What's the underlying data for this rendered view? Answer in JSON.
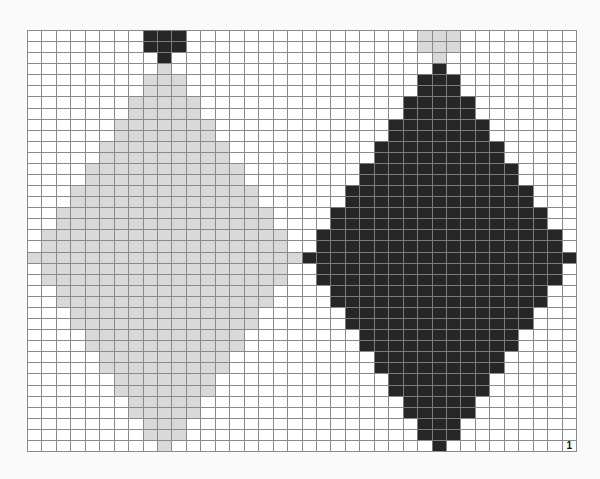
{
  "figure": {
    "label": "1",
    "grid": {
      "columns": 38,
      "rows": 38,
      "legend": {
        ".": "white",
        "L": "light-gray",
        "D": "dark"
      },
      "colors": {
        "white": "#ffffff",
        "light": "#d9d9d9",
        "dark": "#262626",
        "line": "#8a8a8a"
      },
      "cells": [
        "........DDD................LLL........",
        "........DDD................LLL........",
        ".........D..................L.........",
        ".........L..................D.........",
        "........LLL................DDD........",
        "........LLL................DDD........",
        ".......LLLLL..............DDDDD.......",
        ".......LLLLL..............DDDDD.......",
        "......LLLLLLL............DDDDDDD......",
        "......LLLLLLL............DDDDDDD......",
        ".....LLLLLLLLL..........DDDDDDDDD.....",
        ".....LLLLLLLLL..........DDDDDDDDD.....",
        "....LLLLLLLLLLL........DDDDDDDDDDD....",
        "....LLLLLLLLLLL........DDDDDDDDDDD....",
        "...LLLLLLLLLLLLL......DDDDDDDDDDDDD...",
        "...LLLLLLLLLLLLL......DDDDDDDDDDDDD...",
        "..LLLLLLLLLLLLLLL....DDDDDDDDDDDDDDD..",
        "..LLLLLLLLLLLLLLL....DDDDDDDDDDDDDDD..",
        ".LLLLLLLLLLLLLLLLL..DDDDDDDDDDDDDDDDD.",
        ".LLLLLLLLLLLLLLLLL..DDDDDDDDDDDDDDDDD.",
        "LLLLLLLLLLLLLLLLLLLDDDDDDDDDDDDDDDDDDD",
        ".LLLLLLLLLLLLLLLLL..DDDDDDDDDDDDDDDDD.",
        ".LLLLLLLLLLLLLLLLL..DDDDDDDDDDDDDDDDD.",
        "..LLLLLLLLLLLLLLL....DDDDDDDDDDDDDDD..",
        "..LLLLLLLLLLLLLLL....DDDDDDDDDDDDDDD..",
        "...LLLLLLLLLLLLL......DDDDDDDDDDDDD...",
        "...LLLLLLLLLLLLL......DDDDDDDDDDDDD...",
        "....LLLLLLLLLLL........DDDDDDDDDDD....",
        "....LLLLLLLLLLL........DDDDDDDDDDD....",
        ".....LLLLLLLLL..........DDDDDDDDD.....",
        ".....LLLLLLLLL..........DDDDDDDDD.....",
        "......LLLLLLL............DDDDDDD......",
        "......LLLLLLL............DDDDDDD......",
        ".......LLLLL..............DDDDD.......",
        ".......LLLLL..............DDDDD.......",
        "........LLL................DDD........",
        "........LLL................DDD........",
        ".........L..................D........."
      ]
    }
  }
}
